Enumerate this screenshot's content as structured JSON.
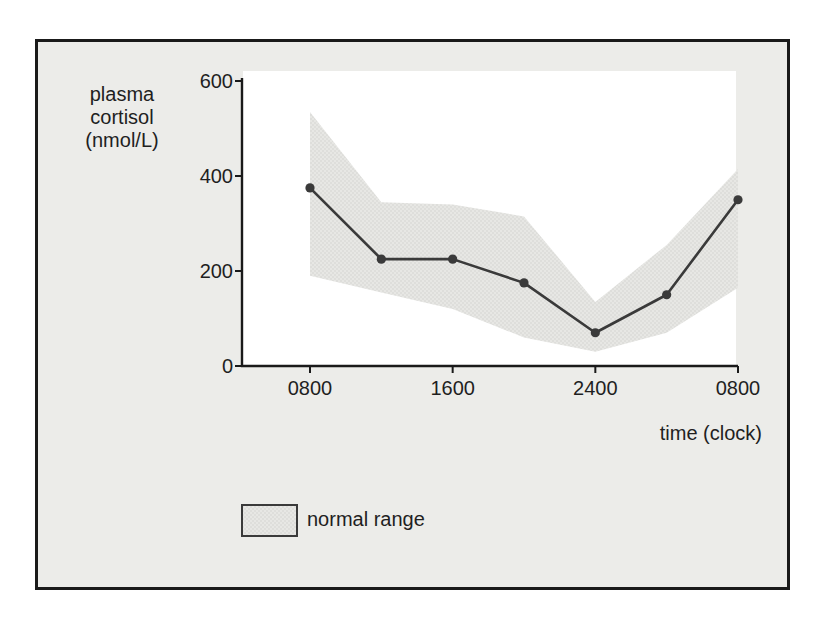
{
  "colors": {
    "page_background": "#ffffff",
    "frame_border": "#1a1a1a",
    "frame_background": "#ecece9",
    "plot_background": "#ffffff",
    "axis_color": "#1a1a1a",
    "line_color": "#3a3a3a",
    "band_base": "#e7e7e4",
    "band_dot": "#d4d4d1",
    "text_color": "#1f1f1f"
  },
  "chart_data": {
    "type": "line",
    "title": "",
    "ylabel_lines": [
      "plasma",
      "cortisol",
      "(nmol/L)"
    ],
    "xlabel": "time (clock)",
    "x_categories": [
      "0800",
      "1200",
      "1600",
      "2000",
      "2400",
      "0400",
      "0800"
    ],
    "x_tick_indices": [
      0,
      2,
      4,
      6
    ],
    "x_tick_labels": [
      "0800",
      "1600",
      "2400",
      "0800"
    ],
    "y_ticks": [
      0,
      200,
      400,
      600
    ],
    "y_tick_labels": [
      "0",
      "200",
      "400",
      "600"
    ],
    "ylim": [
      0,
      600
    ],
    "grid": false,
    "legend_position": "bottom-left",
    "series": [
      {
        "name": "plasma cortisol",
        "marker": "dot",
        "values": [
          375,
          225,
          225,
          175,
          70,
          150,
          350
        ]
      }
    ],
    "band": {
      "label": "normal range",
      "upper": [
        535,
        345,
        340,
        315,
        135,
        255,
        415
      ],
      "lower": [
        190,
        155,
        120,
        60,
        30,
        70,
        165
      ]
    },
    "legend": {
      "entries": [
        {
          "label": "normal range",
          "swatch": "shaded-band"
        }
      ]
    }
  }
}
